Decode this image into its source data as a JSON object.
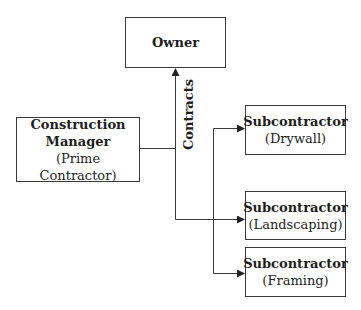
{
  "diagram": {
    "owner": {
      "title": "Owner"
    },
    "construction_manager": {
      "title_line1": "Construction",
      "title_line2": "Manager",
      "subtitle": "(Prime Contractor)"
    },
    "edge_label": "Contracts",
    "subcontractors": [
      {
        "title": "Subcontractor",
        "subtitle": "(Drywall)"
      },
      {
        "title": "Subcontractor",
        "subtitle": "(Landscaping)"
      },
      {
        "title": "Subcontractor",
        "subtitle": "(Framing)"
      }
    ],
    "line_color": "#3a3a3a"
  }
}
